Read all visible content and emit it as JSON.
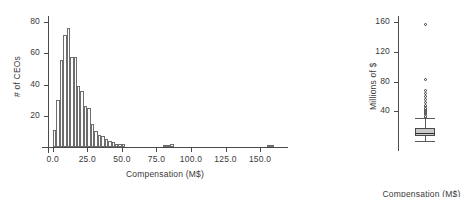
{
  "figure": {
    "panels": [
      "histogram",
      "boxplot"
    ],
    "background": "#ffffff",
    "ink_color": "#3a3a3a"
  },
  "chart_data": [
    {
      "type": "bar",
      "id": "histogram",
      "title": "",
      "xlabel": "Compensation (M$)",
      "ylabel": "# of CEOs",
      "xlim": [
        -3.5,
        163.0
      ],
      "ylim": [
        0,
        84
      ],
      "xticks": [
        0.0,
        25.0,
        50.0,
        75.0,
        100.0,
        125.0,
        150.0
      ],
      "xticklabels": [
        "0.0",
        "25.0",
        "50.0",
        "75.0",
        "100.0",
        "125.0",
        "150.0"
      ],
      "yticks": [
        20,
        40,
        60,
        80
      ],
      "yticklabels": [
        "20",
        "40",
        "60",
        "80"
      ],
      "grid": false,
      "legend": null,
      "bin_width": 2.5,
      "bin_starts": [
        0.0,
        2.5,
        5.0,
        7.5,
        10.0,
        12.5,
        15.0,
        17.5,
        20.0,
        22.5,
        25.0,
        27.5,
        30.0,
        32.5,
        35.0,
        37.5,
        40.0,
        42.5,
        45.0,
        47.5,
        50.0,
        52.5,
        55.0,
        57.5,
        60.0,
        62.5,
        65.0,
        67.5,
        70.0,
        72.5,
        75.0,
        77.5,
        80.0,
        82.5,
        85.0,
        87.5,
        90.0,
        92.5,
        95.0,
        97.5,
        100.0,
        102.5,
        105.0,
        107.5,
        110.0,
        112.5,
        115.0,
        117.5,
        120.0,
        122.5,
        125.0,
        127.5,
        130.0,
        132.5,
        135.0,
        137.5,
        140.0,
        142.5,
        145.0,
        147.5,
        150.0,
        152.5,
        155.0,
        157.5,
        160.0
      ],
      "categories": [
        "0.0",
        "2.5",
        "5.0",
        "7.5",
        "10.0",
        "12.5",
        "15.0",
        "17.5",
        "20.0",
        "22.5",
        "25.0",
        "27.5",
        "30.0",
        "32.5",
        "35.0",
        "37.5",
        "40.0",
        "42.5",
        "45.0",
        "47.5",
        "50.0",
        "52.5",
        "55.0",
        "57.5",
        "60.0",
        "62.5",
        "65.0",
        "67.5",
        "70.0",
        "72.5",
        "75.0",
        "77.5",
        "80.0",
        "82.5",
        "85.0",
        "87.5",
        "90.0",
        "92.5",
        "95.0",
        "97.5",
        "100.0",
        "102.5",
        "105.0",
        "107.5",
        "110.0",
        "112.5",
        "115.0",
        "117.5",
        "120.0",
        "122.5",
        "125.0",
        "127.5",
        "130.0",
        "132.5",
        "135.0",
        "137.5",
        "140.0",
        "142.5",
        "145.0",
        "147.5",
        "150.0",
        "152.5",
        "155.0",
        "157.5",
        "160.0"
      ],
      "values": [
        11,
        30,
        56,
        72,
        76,
        58,
        58,
        39,
        36,
        26,
        25,
        15,
        10,
        8,
        7,
        5,
        4,
        3,
        2,
        2,
        2,
        0,
        0,
        0,
        0,
        0,
        0,
        0,
        0,
        0,
        0,
        0,
        1,
        1,
        2,
        0,
        0,
        0,
        0,
        0,
        0,
        0,
        0,
        0,
        0,
        0,
        0,
        0,
        0,
        0,
        0,
        0,
        0,
        0,
        0,
        0,
        0,
        0,
        0,
        0,
        0,
        0,
        1,
        1,
        0
      ]
    },
    {
      "type": "boxplot",
      "id": "boxplot",
      "title": "",
      "xlabel": "Compensation (M$)",
      "ylabel": "Millions of $",
      "ylim": [
        -8,
        168
      ],
      "yticks": [
        40,
        80,
        120,
        160
      ],
      "yticklabels": [
        "40",
        "80",
        "120",
        "160"
      ],
      "grid": false,
      "legend": null,
      "box": {
        "whisker_low": 0.5,
        "q1": 7.0,
        "median": 11.0,
        "q3": 17.0,
        "whisker_high": 31.0
      },
      "outliers": [
        32.0,
        33.5,
        35.0,
        36.5,
        38.0,
        39.5,
        41.0,
        42.5,
        44.0,
        46.0,
        48.0,
        52.0,
        56.0,
        60.0,
        64.0,
        68.0,
        83.0,
        156.0
      ]
    }
  ]
}
